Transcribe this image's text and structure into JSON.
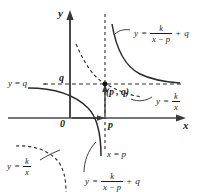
{
  "figure": {
    "background_color": "#ffffff",
    "ink_color": "#1a1a1a"
  },
  "axes": {
    "y_axis_label": "y",
    "x_axis_label": "x",
    "origin_label": "0",
    "y_tick_label": "q",
    "x_tick_label": "p"
  },
  "labels": {
    "asymptote_horizontal": {
      "lhs": "y",
      "eq": "=",
      "rhs": "q",
      "text": "y = q"
    },
    "asymptote_vertical": {
      "lhs": "x",
      "eq": "=",
      "rhs": "p",
      "text": "x = p"
    },
    "point": {
      "open": "(",
      "x": "p",
      "comma": ",",
      "y": "q",
      "close": ")",
      "text": "(p , q)"
    },
    "equation_translated": {
      "lhs": "y",
      "eq": "=",
      "numerator": "k",
      "denominator": "x − p",
      "plus": "+",
      "constant": "q",
      "text": "y = k/(x − p) + q"
    },
    "equation_base": {
      "lhs": "y",
      "eq": "=",
      "numerator": "k",
      "denominator": "x",
      "text": "y = k/x"
    }
  },
  "curves": {
    "solid_name": "y = k/(x-p) + q",
    "dashed_name": "y = k/x"
  }
}
